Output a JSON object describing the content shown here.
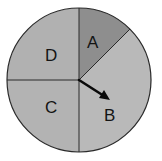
{
  "spinner": {
    "center": [
      79,
      80
    ],
    "radius": 72,
    "outline_color": "#2a2a2a",
    "sections": [
      {
        "label": "A",
        "fill": "#8e8e8e",
        "label_pos": [
          93,
          47
        ]
      },
      {
        "label": "B",
        "fill": "#b9b9b9",
        "label_pos": [
          110,
          120
        ]
      },
      {
        "label": "C",
        "fill": "#b3b3b3",
        "label_pos": [
          51,
          112
        ]
      },
      {
        "label": "D",
        "fill": "#b1b1b1",
        "label_pos": [
          51,
          60
        ]
      }
    ],
    "pointer": {
      "from": [
        79,
        80
      ],
      "to": [
        110,
        100
      ],
      "color": "#0a0a0a"
    }
  }
}
